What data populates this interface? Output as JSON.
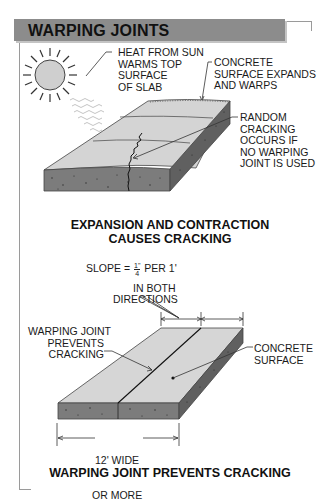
{
  "title": "WARPING JOINTS",
  "diagram1": {
    "labels": {
      "heat": "HEAT FROM SUN\nWARMS TOP\nSURFACE\nOF SLAB",
      "expands": "CONCRETE\nSURFACE EXPANDS\nAND WARPS",
      "random": "RANDOM\nCRACKING\nOCCURS IF\nNO WARPING\nJOINT IS USED"
    },
    "caption_line1": "EXPANSION AND CONTRACTION",
    "caption_line2": "CAUSES CRACKING",
    "icons": [
      "sun-icon",
      "heat-wave-icon"
    ]
  },
  "diagram2": {
    "slope": {
      "prefix": "SLOPE = ",
      "fraction_num": "1\"",
      "fraction_den": "4",
      "suffix": " PER 1'",
      "line2": "IN BOTH",
      "line3": "DIRECTIONS"
    },
    "labels": {
      "joint": "WARPING JOINT\nPREVENTS\nCRACKING",
      "surface": "CONCRETE\nSURFACE",
      "width_line1": "12' WIDE",
      "width_line2": "OR MORE"
    },
    "caption": "WARPING JOINT PREVENTS CRACKING"
  },
  "colors": {
    "title_bar": "#8c8c8c",
    "slab_top": "#d4d4d4",
    "slab_side": "#7a7a7a",
    "slab_edge": "#5e5e5e"
  }
}
